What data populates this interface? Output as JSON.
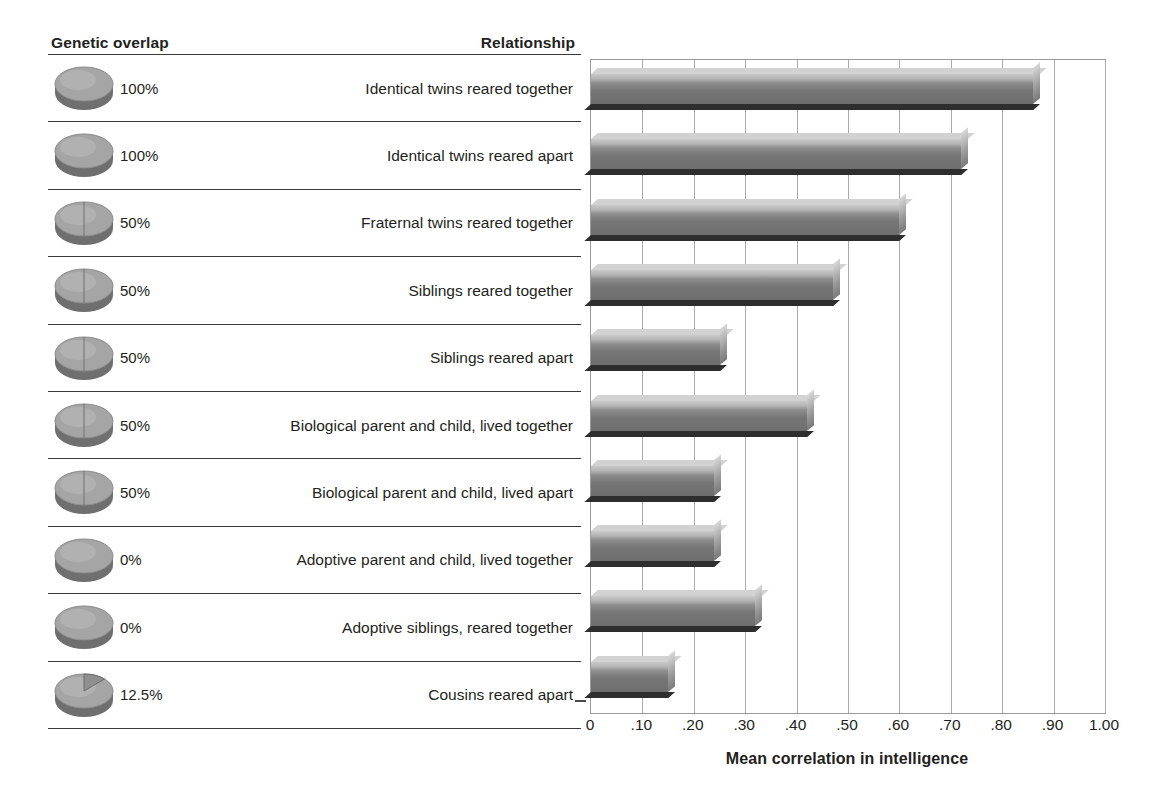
{
  "headers": {
    "genetic_overlap": "Genetic overlap",
    "relationship": "Relationship"
  },
  "axis": {
    "title": "Mean correlation in intelligence",
    "ticks": [
      "0",
      ".10",
      ".20",
      ".30",
      ".40",
      ".50",
      ".60",
      ".70",
      ".80",
      ".90",
      "1.00"
    ]
  },
  "colors": {
    "bar_face": "#8d8d8d",
    "bar_top": "#d2d2d2",
    "bar_shadow": "#2e2e2e",
    "gridline": "#a9a9a9",
    "rule": "#3a3a3a",
    "text": "#231f20"
  },
  "rows": [
    {
      "overlap": "100%",
      "overlap_fraction": 1.0,
      "icon": "pie-disc-100-icon",
      "relationship": "Identical twins reared together",
      "value": 0.86
    },
    {
      "overlap": "100%",
      "overlap_fraction": 1.0,
      "icon": "pie-disc-100-icon",
      "relationship": "Identical twins reared apart",
      "value": 0.72
    },
    {
      "overlap": "50%",
      "overlap_fraction": 0.5,
      "icon": "pie-disc-50-icon",
      "relationship": "Fraternal twins reared together",
      "value": 0.6
    },
    {
      "overlap": "50%",
      "overlap_fraction": 0.5,
      "icon": "pie-disc-50-icon",
      "relationship": "Siblings reared together",
      "value": 0.47
    },
    {
      "overlap": "50%",
      "overlap_fraction": 0.5,
      "icon": "pie-disc-50-icon",
      "relationship": "Siblings reared apart",
      "value": 0.25
    },
    {
      "overlap": "50%",
      "overlap_fraction": 0.5,
      "icon": "pie-disc-50-icon",
      "relationship": "Biological parent and child, lived together",
      "value": 0.42
    },
    {
      "overlap": "50%",
      "overlap_fraction": 0.5,
      "icon": "pie-disc-50-icon",
      "relationship": "Biological parent and child, lived apart",
      "value": 0.24
    },
    {
      "overlap": "0%",
      "overlap_fraction": 0.0,
      "icon": "pie-disc-0-icon",
      "relationship": "Adoptive parent and child, lived together",
      "value": 0.24
    },
    {
      "overlap": "0%",
      "overlap_fraction": 0.0,
      "icon": "pie-disc-0-icon",
      "relationship": "Adoptive siblings, reared together",
      "value": 0.32
    },
    {
      "overlap": "12.5%",
      "overlap_fraction": 0.125,
      "icon": "pie-disc-12-5-icon",
      "relationship": "Cousins reared apart",
      "value": 0.15
    }
  ],
  "chart_data": {
    "type": "bar",
    "orientation": "horizontal",
    "title": "",
    "xlabel": "Mean correlation in intelligence",
    "ylabel": "Relationship",
    "xlim": [
      0,
      1.0
    ],
    "xticks": [
      0,
      0.1,
      0.2,
      0.3,
      0.4,
      0.5,
      0.6,
      0.7,
      0.8,
      0.9,
      1.0
    ],
    "xticklabels": [
      "0",
      ".10",
      ".20",
      ".30",
      ".40",
      ".50",
      ".60",
      ".70",
      ".80",
      ".90",
      "1.00"
    ],
    "grid": "vertical",
    "legend": "none",
    "categories": [
      "Identical twins reared together",
      "Identical twins reared apart",
      "Fraternal twins reared together",
      "Siblings reared together",
      "Siblings reared apart",
      "Biological parent and child, lived together",
      "Biological parent and child, lived apart",
      "Adoptive parent and child, lived together",
      "Adoptive siblings, reared together",
      "Cousins reared apart"
    ],
    "values": [
      0.86,
      0.72,
      0.6,
      0.47,
      0.25,
      0.42,
      0.24,
      0.24,
      0.32,
      0.15
    ],
    "annotations": {
      "genetic_overlap": [
        "100%",
        "100%",
        "50%",
        "50%",
        "50%",
        "50%",
        "50%",
        "0%",
        "0%",
        "12.5%"
      ]
    }
  }
}
